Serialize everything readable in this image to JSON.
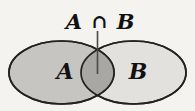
{
  "diagram": {
    "type": "venn",
    "title": {
      "left_set": "A",
      "operator": "∩",
      "right_set": "B",
      "text": "A ∩ B"
    },
    "sets": [
      {
        "label": "A",
        "fill": "#c6c5c1"
      },
      {
        "label": "B",
        "fill": "#e2e1dd"
      }
    ],
    "intersection": {
      "label": "A ∩ B",
      "fill": "#a8a7a4"
    },
    "colors": {
      "background": "#f4f3f0",
      "outline": "#222222",
      "text": "#111111",
      "leader_line": "#4a4a4a"
    }
  }
}
